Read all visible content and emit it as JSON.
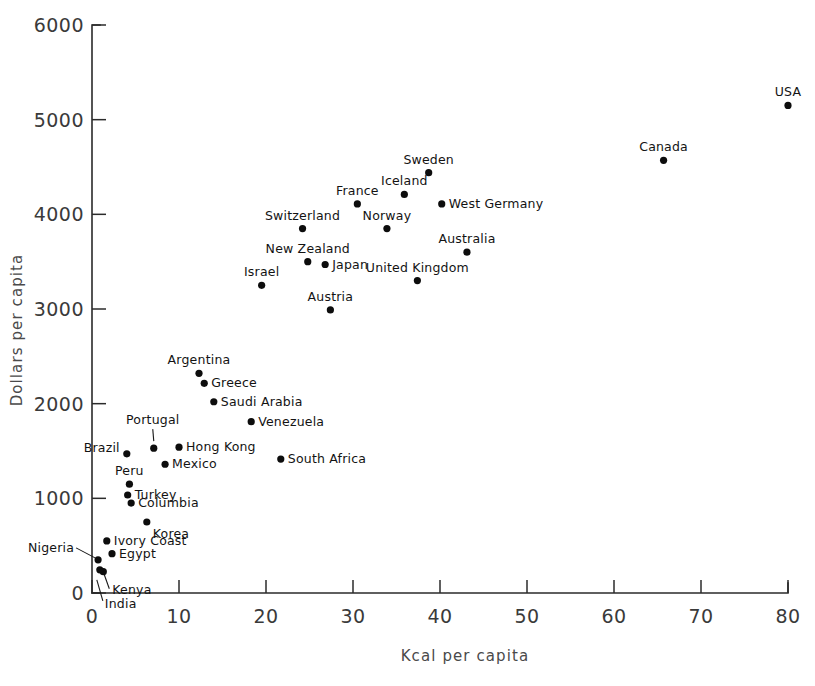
{
  "chart_data": {
    "type": "scatter",
    "title": "",
    "xlabel": "Kcal per capita",
    "ylabel": "Dollars per capita",
    "xlim": [
      0,
      80
    ],
    "ylim": [
      0,
      6000
    ],
    "xticks": [
      0,
      10,
      20,
      30,
      40,
      50,
      60,
      70,
      80
    ],
    "xtick_labels": [
      "0",
      "10",
      "20",
      "30",
      "40",
      "50",
      "60",
      "70",
      "80"
    ],
    "yticks": [
      0,
      1000,
      2000,
      3000,
      4000,
      5000,
      6000
    ],
    "ytick_labels": [
      "0",
      "1000",
      "2000",
      "3000",
      "4000",
      "5000",
      "6000"
    ],
    "grid": false,
    "legend": "none",
    "marker": "filled-circle",
    "marker_color": "#0d0d0d",
    "points": [
      {
        "label": "USA",
        "x": 80.0,
        "y": 5150,
        "label_pos": "above"
      },
      {
        "label": "Canada",
        "x": 65.7,
        "y": 4570,
        "label_pos": "above"
      },
      {
        "label": "Sweden",
        "x": 38.7,
        "y": 4440,
        "label_pos": "above"
      },
      {
        "label": "Iceland",
        "x": 35.9,
        "y": 4210,
        "label_pos": "above"
      },
      {
        "label": "France",
        "x": 30.5,
        "y": 4110,
        "label_pos": "above"
      },
      {
        "label": "West Germany",
        "x": 40.2,
        "y": 4110,
        "label_pos": "right"
      },
      {
        "label": "Norway",
        "x": 33.9,
        "y": 3850,
        "label_pos": "above"
      },
      {
        "label": "Switzerland",
        "x": 24.2,
        "y": 3850,
        "label_pos": "above"
      },
      {
        "label": "Australia",
        "x": 43.1,
        "y": 3600,
        "label_pos": "above"
      },
      {
        "label": "New Zealand",
        "x": 24.8,
        "y": 3500,
        "label_pos": "above"
      },
      {
        "label": "Japan",
        "x": 26.8,
        "y": 3470,
        "label_pos": "right"
      },
      {
        "label": "United Kingdom",
        "x": 37.4,
        "y": 3300,
        "label_pos": "above"
      },
      {
        "label": "Israel",
        "x": 19.5,
        "y": 3250,
        "label_pos": "above"
      },
      {
        "label": "Austria",
        "x": 27.4,
        "y": 2990,
        "label_pos": "above"
      },
      {
        "label": "Argentina",
        "x": 12.3,
        "y": 2320,
        "label_pos": "above"
      },
      {
        "label": "Greece",
        "x": 12.9,
        "y": 2215,
        "label_pos": "right"
      },
      {
        "label": "Saudi Arabia",
        "x": 14.0,
        "y": 2020,
        "label_pos": "right"
      },
      {
        "label": "Venezuela",
        "x": 18.3,
        "y": 1810,
        "label_pos": "right"
      },
      {
        "label": "Portugal",
        "x": 7.1,
        "y": 1530,
        "label_pos": "leader-up"
      },
      {
        "label": "Brazil",
        "x": 4.0,
        "y": 1470,
        "label_pos": "left"
      },
      {
        "label": "Hong Kong",
        "x": 10.0,
        "y": 1540,
        "label_pos": "right"
      },
      {
        "label": "Mexico",
        "x": 8.4,
        "y": 1360,
        "label_pos": "right"
      },
      {
        "label": "South Africa",
        "x": 21.7,
        "y": 1415,
        "label_pos": "right"
      },
      {
        "label": "Peru",
        "x": 4.3,
        "y": 1150,
        "label_pos": "above"
      },
      {
        "label": "Turkey",
        "x": 4.1,
        "y": 1035,
        "label_pos": "right"
      },
      {
        "label": "Columbia",
        "x": 4.5,
        "y": 950,
        "label_pos": "right"
      },
      {
        "label": "Korea",
        "x": 6.3,
        "y": 750,
        "label_pos": "below-right"
      },
      {
        "label": "Ivory Coast",
        "x": 1.7,
        "y": 550,
        "label_pos": "right"
      },
      {
        "label": "Egypt",
        "x": 2.3,
        "y": 415,
        "label_pos": "right"
      },
      {
        "label": "Nigeria",
        "x": 0.7,
        "y": 350,
        "label_pos": "leader-left"
      },
      {
        "label": "Kenya",
        "x": 1.3,
        "y": 225,
        "label_pos": "leader-down"
      },
      {
        "label": "India",
        "x": 0.9,
        "y": 245,
        "label_pos": "leader-down2"
      }
    ]
  },
  "axes": {
    "x_title": "Kcal per capita",
    "y_title": "Dollars per capita"
  }
}
